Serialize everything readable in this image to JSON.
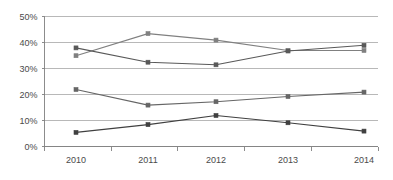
{
  "chart_data": {
    "type": "line",
    "title": "",
    "subtitle": "",
    "xlabel": "",
    "ylabel": "",
    "categories": [
      "2010",
      "2011",
      "2012",
      "2013",
      "2014"
    ],
    "x": [
      2010,
      2011,
      2012,
      2013,
      2014
    ],
    "ylim": [
      0,
      50
    ],
    "ytick_labels": [
      "0%",
      "10%",
      "20%",
      "30%",
      "40%",
      "50%"
    ],
    "ytick_values": [
      0,
      10,
      20,
      30,
      40,
      50
    ],
    "grid": true,
    "grid_axis": "y",
    "legend": false,
    "legend_position": "none",
    "annotations": [],
    "series": [
      {
        "name": "Series 1",
        "color": "#808080",
        "marker": "square",
        "values": [
          35.0,
          43.5,
          41.0,
          37.0,
          37.0
        ]
      },
      {
        "name": "Series 2",
        "color": "#595959",
        "marker": "square",
        "values": [
          38.0,
          32.5,
          31.5,
          36.8,
          39.0
        ]
      },
      {
        "name": "Series 3",
        "color": "#666666",
        "marker": "square",
        "values": [
          22.0,
          16.0,
          17.3,
          19.3,
          21.0
        ]
      },
      {
        "name": "Series 4",
        "color": "#404040",
        "marker": "square",
        "values": [
          5.5,
          8.5,
          12.0,
          9.2,
          6.0
        ]
      }
    ]
  },
  "axes": {
    "y_axis_name": "percent-axis",
    "x_axis_name": "year-axis"
  }
}
